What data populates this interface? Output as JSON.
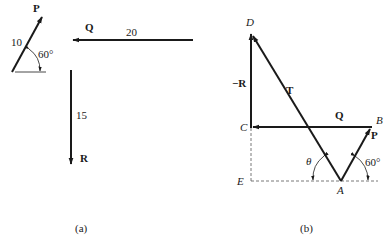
{
  "figure": {
    "panel_a": {
      "caption": "(a)",
      "vectors": {
        "P": {
          "label": "P",
          "magnitude": "10",
          "angle_label": "60°"
        },
        "Q": {
          "label": "Q",
          "magnitude": "20"
        },
        "R": {
          "label": "R",
          "magnitude": "15"
        }
      }
    },
    "panel_b": {
      "caption": "(b)",
      "points": {
        "A": "A",
        "B": "B",
        "C": "C",
        "D": "D",
        "E": "E"
      },
      "vectors": {
        "neg_R": {
          "label": "−R"
        },
        "T": {
          "label": "T"
        },
        "Q": {
          "label": "Q"
        },
        "P": {
          "label": "P"
        }
      },
      "angles": {
        "theta": "θ",
        "sixty": "60°"
      }
    },
    "colors": {
      "ink": "#1a1a1a",
      "dashed": "#555555",
      "background": "#ffffff"
    }
  }
}
